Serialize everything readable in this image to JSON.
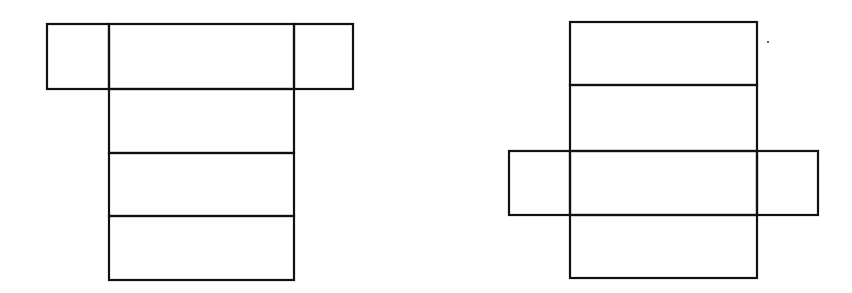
{
  "diagram": {
    "type": "cuboid-nets",
    "stroke_color": "#111111",
    "background": "#ffffff",
    "figures": [
      {
        "name": "net-a",
        "layout": "T-shape: wings attached to the top face of a 4-face vertical strip",
        "column": {
          "x": 109,
          "width": 185,
          "rows_y": [
            24,
            89,
            153,
            216,
            280
          ]
        },
        "wings": {
          "y_top": 24,
          "y_bottom": 89,
          "left_x": 47,
          "right_x": 353
        }
      },
      {
        "name": "net-b",
        "layout": "Cross-shape: wings attached to the third face of a 4-face vertical strip",
        "column": {
          "x": 570,
          "width": 187,
          "rows_y": [
            22,
            85,
            151,
            215,
            278
          ]
        },
        "wings": {
          "y_top": 151,
          "y_bottom": 215,
          "left_x": 509,
          "right_x": 818
        }
      }
    ],
    "artifacts": [
      {
        "name": "stray-dot",
        "x": 768,
        "y": 42
      }
    ]
  }
}
